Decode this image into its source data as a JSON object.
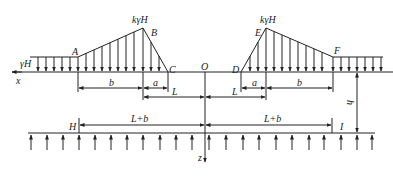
{
  "diagram": {
    "colors": {
      "line": "#222222",
      "background": "#ffffff"
    },
    "points": {
      "A": "A",
      "B": "B",
      "C": "C",
      "D": "D",
      "E": "E",
      "F": "F",
      "O": "O",
      "H": "H",
      "I": "I"
    },
    "loads": {
      "left_surcharge": "γH",
      "left_peak": "kγH",
      "right_peak": "kγH"
    },
    "axes": {
      "x": "x",
      "z": "z"
    },
    "dimensions": {
      "left_b": "b",
      "left_a": "a",
      "left_L": "L",
      "right_b": "b",
      "right_a": "a",
      "right_L": "L",
      "depth": "h",
      "bottom_left": "L+b",
      "bottom_right": "L+b"
    }
  }
}
